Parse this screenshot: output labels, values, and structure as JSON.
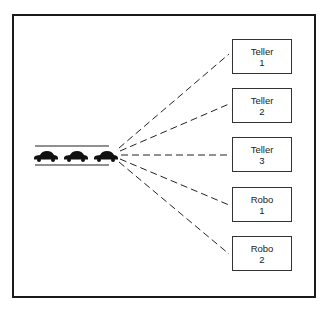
{
  "diagram": {
    "type": "queue-to-servers",
    "queue": {
      "cars": 3,
      "icon": "car-icon"
    },
    "servers": [
      {
        "line1": "Teller",
        "line2": "1"
      },
      {
        "line1": "Teller",
        "line2": "2"
      },
      {
        "line1": "Teller",
        "line2": "3"
      },
      {
        "line1": "Robo",
        "line2": "1"
      },
      {
        "line1": "Robo",
        "line2": "2"
      }
    ],
    "colors": {
      "ink": "#1a1a1a",
      "background": "#ffffff"
    }
  }
}
